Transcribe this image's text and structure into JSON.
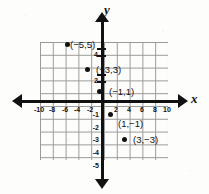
{
  "chart_data": {
    "type": "scatter",
    "title": "",
    "xlabel": "x",
    "ylabel": "y",
    "xlim": [
      -10,
      10
    ],
    "ylim": [
      -5,
      5
    ],
    "grid": true,
    "legend": "none",
    "x_ticks": [
      -10,
      -8,
      -6,
      -4,
      -2,
      2,
      4,
      6,
      8,
      10
    ],
    "x_tick_labels": [
      "-10",
      "-8",
      "-6",
      "-4",
      "-2",
      "2",
      "4",
      "6",
      "8",
      "10"
    ],
    "y_ticks": [
      4,
      2,
      -1,
      -2,
      -3,
      -4,
      -5
    ],
    "y_tick_labels": [
      "4",
      "2",
      "-1",
      "-2",
      "-3",
      "-4",
      "-5"
    ],
    "points": [
      {
        "x": -5,
        "y": 5,
        "label": "(−5,5)",
        "label_side": "right"
      },
      {
        "x": -3,
        "y": 3,
        "label": "(−3,3)",
        "label_side": "right"
      },
      {
        "x": -1,
        "y": 1,
        "label": "(−1,1)",
        "label_side": "right"
      },
      {
        "x": 1,
        "y": -1,
        "label": "(1,−1)",
        "label_side": "below-right"
      },
      {
        "x": 3,
        "y": -3,
        "label": "(3,−3)",
        "label_side": "right"
      }
    ],
    "axis_arrows": [
      "left",
      "right",
      "up",
      "down"
    ],
    "colors": {
      "axis": "#111111",
      "grid": "#8a8a8a",
      "point": "#111111",
      "background": "#fdfdfc"
    }
  },
  "axes": {
    "x_name": "x",
    "y_name": "y"
  },
  "ticks": {
    "x": [
      {
        "label": "-10",
        "px": 39,
        "py": 106
      },
      {
        "label": "-8",
        "px": 52,
        "py": 106
      },
      {
        "label": "-6",
        "px": 65,
        "py": 106
      },
      {
        "label": "-4",
        "px": 77,
        "py": 106
      },
      {
        "label": "-2",
        "px": 90,
        "py": 106
      },
      {
        "label": "2",
        "px": 116,
        "py": 106
      },
      {
        "label": "4",
        "px": 129,
        "py": 106
      },
      {
        "label": "6",
        "px": 142,
        "py": 106
      },
      {
        "label": "8",
        "px": 155,
        "py": 106
      },
      {
        "label": "10",
        "px": 167,
        "py": 106
      }
    ],
    "y": [
      {
        "label": "4",
        "px": 98,
        "py": 54
      },
      {
        "label": "2",
        "px": 98,
        "py": 80
      },
      {
        "label": "-1",
        "px": 99,
        "py": 114
      },
      {
        "label": "-2",
        "px": 99,
        "py": 127
      },
      {
        "label": "-3",
        "px": 99,
        "py": 139
      },
      {
        "label": "-4",
        "px": 99,
        "py": 152
      },
      {
        "label": "-5",
        "px": 99,
        "py": 165
      }
    ]
  },
  "marks": {
    "y_tick_bars": [
      {
        "py": 48
      },
      {
        "py": 55
      },
      {
        "py": 74
      },
      {
        "py": 81
      }
    ]
  },
  "plotted": [
    {
      "name": "point-neg5-5",
      "px": 67,
      "py": 44,
      "label": "(−5,5)",
      "lx": 70,
      "ly": 45
    },
    {
      "name": "point-neg3-3",
      "px": 87,
      "py": 69,
      "label": "(−3,3)",
      "lx": 96,
      "ly": 70
    },
    {
      "name": "point-neg1-1",
      "px": 99,
      "py": 91,
      "label": "(−1,1)",
      "lx": 109,
      "ly": 92
    },
    {
      "name": "point-1-neg1",
      "px": 110,
      "py": 114,
      "label": "(1,−1)",
      "lx": 118,
      "ly": 124
    },
    {
      "name": "point-3-neg3",
      "px": 124,
      "py": 139,
      "label": "(3,−3)",
      "lx": 133,
      "ly": 140
    }
  ]
}
